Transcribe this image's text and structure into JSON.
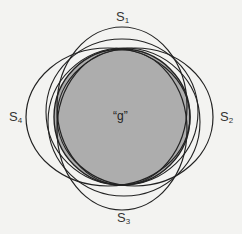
{
  "diagram": {
    "center_label": "“g”",
    "sets": [
      {
        "name": "S",
        "index": "1",
        "position": "top"
      },
      {
        "name": "S",
        "index": "2",
        "position": "right"
      },
      {
        "name": "S",
        "index": "3",
        "position": "bottom"
      },
      {
        "name": "S",
        "index": "4",
        "position": "left"
      }
    ],
    "colors": {
      "background": "#f3f3f1",
      "fill": "#adadad",
      "stroke": "#222222"
    }
  }
}
